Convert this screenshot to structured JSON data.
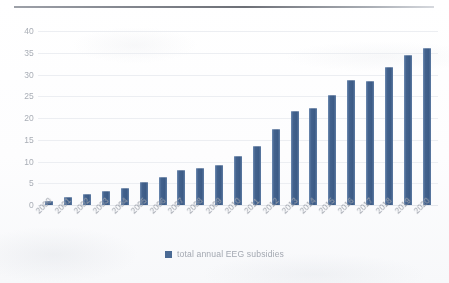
{
  "chart_data": {
    "type": "bar",
    "title": "",
    "subtitle": "",
    "xlabel": "",
    "ylabel": "",
    "ylim": [
      0,
      40
    ],
    "yticks": [
      0,
      5,
      10,
      15,
      20,
      25,
      30,
      35,
      40
    ],
    "grid": true,
    "legend_position": "bottom",
    "legend": [
      "total annual EEG subsidies"
    ],
    "categories": [
      "2000",
      "2001",
      "2002",
      "2003",
      "2004",
      "2005",
      "2006",
      "2007",
      "2008",
      "2009",
      "2010",
      "2011",
      "2012",
      "2013",
      "2014",
      "2015",
      "2016",
      "2017",
      "2018",
      "2019",
      "2020"
    ],
    "series": [
      {
        "name": "total annual EEG subsidies",
        "color": "#4a6a94",
        "values": [
          1.0,
          1.8,
          2.6,
          3.2,
          4.0,
          5.2,
          6.4,
          8.0,
          8.6,
          9.2,
          11.2,
          13.6,
          17.4,
          21.6,
          22.4,
          25.4,
          28.8,
          28.4,
          31.8,
          34.6,
          36.0
        ]
      }
    ]
  },
  "legend": {
    "swatch_color": "#4a6a94",
    "label": "total annual EEG subsidies"
  },
  "axes": {
    "y_labels": [
      "40",
      "35",
      "30",
      "25",
      "20",
      "15",
      "10",
      "5",
      "0"
    ],
    "x_labels": [
      "2000",
      "2001",
      "2002",
      "2003",
      "2004",
      "2005",
      "2006",
      "2007",
      "2008",
      "2009",
      "2010",
      "2011",
      "2012",
      "2013",
      "2014",
      "2015",
      "2016",
      "2017",
      "2018",
      "2019",
      "2020"
    ]
  }
}
